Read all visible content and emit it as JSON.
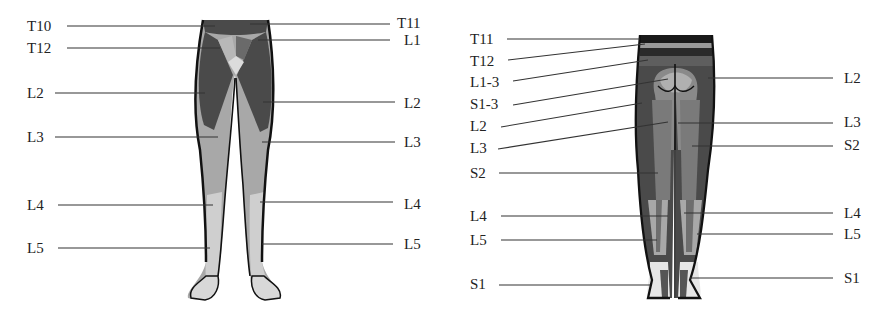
{
  "figure": {
    "front_view": {
      "name": "Anterior view",
      "labels_left": [
        {
          "text": "T10",
          "x": 27,
          "y": 19,
          "lx1": 67,
          "ly1": 26,
          "lx2": 215,
          "ly2": 26
        },
        {
          "text": "T12",
          "x": 27,
          "y": 41,
          "lx1": 67,
          "ly1": 48,
          "lx2": 220,
          "ly2": 48
        },
        {
          "text": "L2",
          "x": 27,
          "y": 86,
          "lx1": 55,
          "ly1": 93,
          "lx2": 205,
          "ly2": 93
        },
        {
          "text": "L3",
          "x": 27,
          "y": 130,
          "lx1": 55,
          "ly1": 137,
          "lx2": 218,
          "ly2": 137
        },
        {
          "text": "L4",
          "x": 27,
          "y": 198,
          "lx1": 58,
          "ly1": 205,
          "lx2": 213,
          "ly2": 205
        },
        {
          "text": "L5",
          "x": 27,
          "y": 241,
          "lx1": 58,
          "ly1": 248,
          "lx2": 210,
          "ly2": 248
        }
      ],
      "labels_right": [
        {
          "text": "T11",
          "x": 397,
          "y": 16,
          "lx1": 250,
          "ly1": 24,
          "lx2": 390,
          "ly2": 24
        },
        {
          "text": "L1",
          "x": 404,
          "y": 33,
          "lx1": 258,
          "ly1": 40,
          "lx2": 390,
          "ly2": 40
        },
        {
          "text": "L2",
          "x": 404,
          "y": 96,
          "lx1": 263,
          "ly1": 102,
          "lx2": 395,
          "ly2": 102
        },
        {
          "text": "L3",
          "x": 404,
          "y": 135,
          "lx1": 262,
          "ly1": 142,
          "lx2": 395,
          "ly2": 142
        },
        {
          "text": "L4",
          "x": 404,
          "y": 197,
          "lx1": 260,
          "ly1": 202,
          "lx2": 393,
          "ly2": 202
        },
        {
          "text": "L5",
          "x": 404,
          "y": 237,
          "lx1": 262,
          "ly1": 244,
          "lx2": 393,
          "ly2": 244
        }
      ]
    },
    "back_view": {
      "name": "Posterior view",
      "labels_left": [
        {
          "text": "T11",
          "x": 470,
          "y": 32,
          "lx1": 507,
          "ly1": 39,
          "lx2": 640,
          "ly2": 39
        },
        {
          "text": "T12",
          "x": 470,
          "y": 54,
          "lx1": 508,
          "ly1": 60,
          "lx2": 645,
          "ly2": 44
        },
        {
          "text": "L1-3",
          "x": 470,
          "y": 75,
          "lx1": 513,
          "ly1": 81,
          "lx2": 648,
          "ly2": 60
        },
        {
          "text": "S1-3",
          "x": 470,
          "y": 97,
          "lx1": 513,
          "ly1": 105,
          "lx2": 668,
          "ly2": 79
        },
        {
          "text": "L2",
          "x": 470,
          "y": 119,
          "lx1": 501,
          "ly1": 127,
          "lx2": 642,
          "ly2": 103
        },
        {
          "text": "L3",
          "x": 470,
          "y": 141,
          "lx1": 498,
          "ly1": 149,
          "lx2": 668,
          "ly2": 122
        },
        {
          "text": "S2",
          "x": 470,
          "y": 166,
          "lx1": 499,
          "ly1": 173,
          "lx2": 658,
          "ly2": 173
        },
        {
          "text": "L4",
          "x": 470,
          "y": 209,
          "lx1": 501,
          "ly1": 216,
          "lx2": 668,
          "ly2": 216
        },
        {
          "text": "L5",
          "x": 470,
          "y": 233,
          "lx1": 501,
          "ly1": 240,
          "lx2": 657,
          "ly2": 240
        },
        {
          "text": "S1",
          "x": 470,
          "y": 277,
          "lx1": 499,
          "ly1": 285,
          "lx2": 650,
          "ly2": 285
        }
      ],
      "labels_right": [
        {
          "text": "L2",
          "x": 844,
          "y": 71,
          "lx1": 708,
          "ly1": 78,
          "lx2": 833,
          "ly2": 78
        },
        {
          "text": "L3",
          "x": 844,
          "y": 115,
          "lx1": 678,
          "ly1": 123,
          "lx2": 833,
          "ly2": 123
        },
        {
          "text": "S2",
          "x": 844,
          "y": 138,
          "lx1": 692,
          "ly1": 146,
          "lx2": 833,
          "ly2": 146
        },
        {
          "text": "L4",
          "x": 844,
          "y": 206,
          "lx1": 684,
          "ly1": 213,
          "lx2": 833,
          "ly2": 213
        },
        {
          "text": "L5",
          "x": 844,
          "y": 227,
          "lx1": 697,
          "ly1": 234,
          "lx2": 833,
          "ly2": 234
        },
        {
          "text": "S1",
          "x": 844,
          "y": 271,
          "lx1": 690,
          "ly1": 278,
          "lx2": 833,
          "ly2": 278
        }
      ]
    },
    "colors": {
      "dark": "#4a4a4a",
      "mid": "#7a7a7a",
      "light": "#a8a8a8",
      "pale": "#cfcfcf",
      "outline": "#111111",
      "leader": "#333333"
    }
  }
}
